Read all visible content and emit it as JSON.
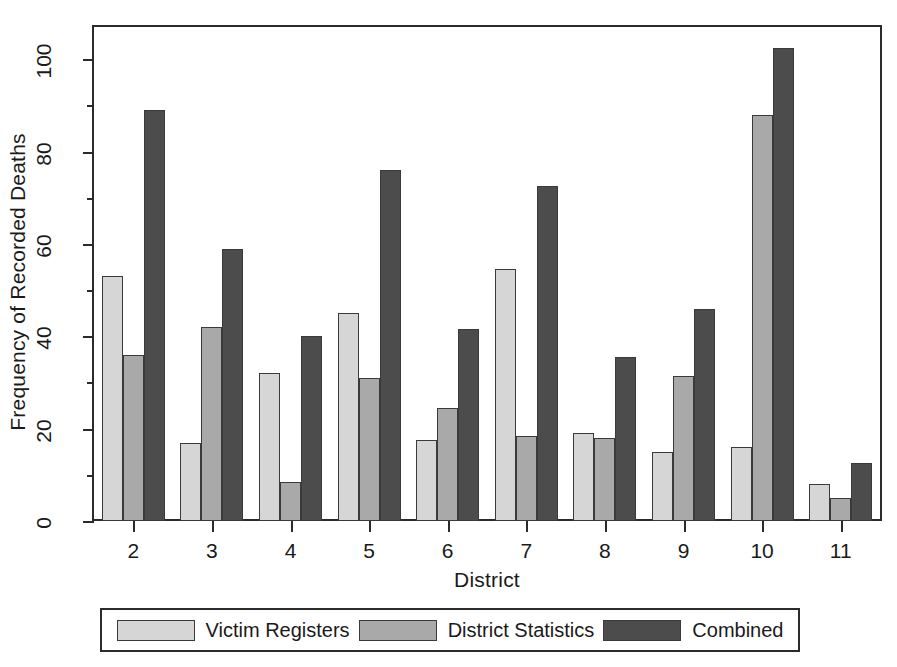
{
  "chart_data": {
    "type": "bar",
    "title": "",
    "xlabel": "District",
    "ylabel": "Frequency of Recorded Deaths",
    "categories": [
      "2",
      "3",
      "4",
      "5",
      "6",
      "7",
      "8",
      "9",
      "10",
      "11"
    ],
    "series": [
      {
        "name": "Victim Registers",
        "color": "#d6d6d6",
        "values": [
          53,
          17,
          32,
          45,
          17.5,
          54.5,
          19,
          15,
          16,
          8
        ]
      },
      {
        "name": "District Statistics",
        "color": "#a9a9a9",
        "values": [
          36,
          42,
          8.5,
          31,
          24.5,
          18.5,
          18,
          31.5,
          88,
          5
        ]
      },
      {
        "name": "Combined",
        "color": "#4c4c4c",
        "values": [
          89,
          59,
          40,
          76,
          41.5,
          72.5,
          35.5,
          46,
          102.5,
          12.5
        ]
      }
    ],
    "ylim": [
      0,
      107
    ],
    "ytick_major": [
      0,
      20,
      40,
      60,
      80,
      100
    ],
    "ytick_minor": [
      10,
      30,
      50,
      70,
      90
    ],
    "ytick_labels": [
      "0",
      "20",
      "40",
      "60",
      "80",
      "100"
    ],
    "grid": false,
    "legend_position": "bottom",
    "axis_color": "#2b2b2b",
    "background": "#ffffff"
  }
}
